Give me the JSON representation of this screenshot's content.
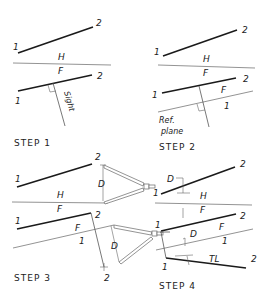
{
  "figure": {
    "steps": [
      {
        "label": "STEP 1",
        "point_labels": [
          "1",
          "2",
          "1",
          "2"
        ],
        "plane_labels": [
          "H",
          "F"
        ],
        "sight_label": "Sight"
      },
      {
        "label": "STEP 2",
        "point_labels": [
          "1",
          "2",
          "1",
          "2"
        ],
        "plane_labels": [
          "H",
          "F",
          "F",
          "1"
        ],
        "ref_label_line1": "Ref.",
        "ref_label_line2": "plane"
      },
      {
        "label": "STEP 3",
        "point_labels": [
          "1",
          "2",
          "1",
          "2",
          "2"
        ],
        "plane_labels": [
          "H",
          "F",
          "F",
          "1"
        ],
        "dim_labels": [
          "D",
          "D"
        ]
      },
      {
        "label": "STEP 4",
        "point_labels": [
          "1",
          "2",
          "1",
          "2",
          "1",
          "2"
        ],
        "plane_labels": [
          "H",
          "F",
          "F",
          "1"
        ],
        "dim_labels": [
          "D",
          "D"
        ],
        "true_length_label": "TL"
      }
    ]
  }
}
